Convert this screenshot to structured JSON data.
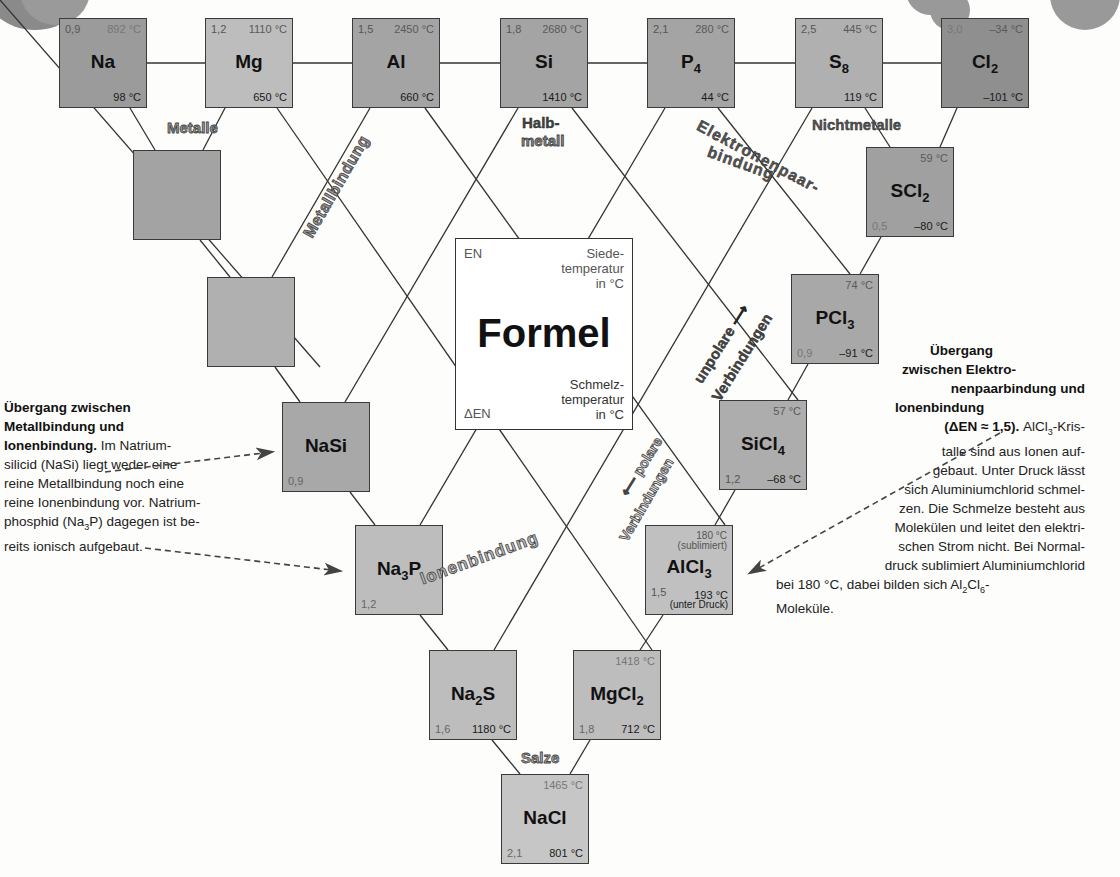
{
  "legend_box": {
    "en_label": "EN",
    "boiling_label_lines": [
      "Siede-",
      "temperatur",
      "in °C"
    ],
    "formula_label": "Formel",
    "melting_label_lines": [
      "Schmelz-",
      "temperatur",
      "in °C"
    ],
    "delta_en_label": "ΔEN"
  },
  "elements": [
    {
      "formula": "Na",
      "en": "0,9",
      "boiling": "892 °C",
      "melting": "98 °C"
    },
    {
      "formula": "Mg",
      "en": "1,2",
      "boiling": "1110 °C",
      "melting": "650 °C"
    },
    {
      "formula": "Al",
      "en": "1,5",
      "boiling": "2450 °C",
      "melting": "660 °C"
    },
    {
      "formula": "Si",
      "en": "1,8",
      "boiling": "2680 °C",
      "melting": "1410 °C"
    },
    {
      "formula": "P",
      "sub": "4",
      "en": "2,1",
      "boiling": "280 °C",
      "melting": "44 °C"
    },
    {
      "formula": "S",
      "sub": "8",
      "en": "2,5",
      "boiling": "445 °C",
      "melting": "119 °C"
    },
    {
      "formula": "Cl",
      "sub": "2",
      "en": "3,0",
      "boiling": "–34 °C",
      "melting": "–101 °C"
    }
  ],
  "compounds": {
    "scl2": {
      "formula": "SCl",
      "sub": "2",
      "delta_en": "0,5",
      "boiling": "59 °C",
      "melting": "–80 °C"
    },
    "pcl3": {
      "formula": "PCl",
      "sub": "3",
      "delta_en": "0,9",
      "boiling": "74 °C",
      "melting": "–91 °C"
    },
    "sicl4": {
      "formula": "SiCl",
      "sub": "4",
      "delta_en": "1,2",
      "boiling": "57 °C",
      "melting": "–68 °C"
    },
    "alcl3": {
      "formula": "AlCl",
      "sub": "3",
      "delta_en": "1,5",
      "boiling": "180 °C",
      "boiling_note": "(sublimiert)",
      "melting": "193 °C",
      "melting_note": "(unter Druck)"
    },
    "nasi": {
      "formula": "NaSi",
      "delta_en": "0,9"
    },
    "na3p": {
      "formula_a": "Na",
      "sub": "3",
      "formula_b": "P",
      "delta_en": "1,2"
    },
    "na2s": {
      "formula_a": "Na",
      "sub": "2",
      "formula_b": "S",
      "delta_en": "1,6",
      "melting": "1180 °C"
    },
    "mgcl2": {
      "formula": "MgCl",
      "sub": "2",
      "delta_en": "1,8",
      "boiling": "1418 °C",
      "melting": "712 °C"
    },
    "nacl": {
      "formula": "NaCl",
      "delta_en": "2,1",
      "boiling": "1465 °C",
      "melting": "801 °C"
    }
  },
  "region_labels": {
    "metalle": "Metalle",
    "halbmetall_1": "Halb-",
    "halbmetall_2": "metall",
    "nichtmetalle": "Nichtmetalle",
    "salze": "Salze",
    "metallbindung": "Metallbindung",
    "elektronenpaar": "Elektronenpaar-",
    "bindung": "bindung",
    "ionenbindung": "Ionenbindung",
    "unpolare": "unpolare ⟶",
    "verbindungen_1": "Verbindungen",
    "polare": "⟵ polare",
    "verbindungen_2": "Verbindungen"
  },
  "notes": {
    "left": {
      "heading_lines": [
        "Übergang zwischen",
        "Metallbindung und",
        "Ionenbindung."
      ],
      "body_lines": [
        " Im Natrium-",
        "silicid (NaSi) liegt weder eine",
        "reine Metallbindung noch eine",
        "reine Ionenbindung vor. Natrium-",
        "phosphid (Na",
        "3",
        "P) dagegen ist be-",
        "reits ionisch aufgebaut."
      ]
    },
    "right": {
      "heading_lines": [
        "Übergang",
        "zwischen Elektro-",
        "nenpaarbindung und",
        "Ionenbindung",
        "(ΔEN ≈ 1,5)."
      ],
      "body_a": " AlCl",
      "body_a_sub": "3",
      "body_a_end": "-Kris-",
      "body_lines": [
        "talle sind aus Ionen auf-",
        "gebaut. Unter Druck lässt",
        "sich Aluminiumchlorid schmel-",
        "zen. Die Schmelze besteht aus",
        "Molekülen und leitet den elektri-",
        "schen Strom nicht. Bei Normal-",
        "druck sublimiert Aluminiumchlorid"
      ],
      "last_a": "bei 180 °C, dabei bilden sich Al",
      "last_sub1": "2",
      "last_b": "Cl",
      "last_sub2": "6",
      "last_c": "-",
      "final": "Moleküle."
    }
  }
}
